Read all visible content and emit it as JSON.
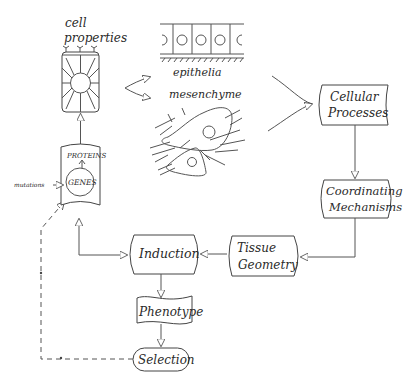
{
  "diagram": {
    "type": "flowchart",
    "nodes": {
      "cell_properties": {
        "label_line1": "cell",
        "label_line2": "properties"
      },
      "epithelia": {
        "label": "epithelia"
      },
      "mesenchyme": {
        "label": "mesenchyme"
      },
      "genome_box": {
        "proteins": "PROTEINS",
        "genes": "GENES",
        "mutations": "mutations"
      },
      "cellular_processes": {
        "line1": "Cellular",
        "line2": "Processes"
      },
      "coordinating_mechanisms": {
        "line1": "Coordinating",
        "line2": "Mechanisms"
      },
      "tissue_geometry": {
        "line1": "Tissue",
        "line2": "Geometry"
      },
      "induction": {
        "label": "Induction"
      },
      "phenotype": {
        "label": "Phenotype"
      },
      "selection": {
        "label": "Selection"
      }
    },
    "edges": [
      {
        "from": "genome_box",
        "to": "cell_properties",
        "style": "solid"
      },
      {
        "from": "cell_properties",
        "to": "epithelia",
        "style": "solid"
      },
      {
        "from": "cell_properties",
        "to": "mesenchyme",
        "style": "solid"
      },
      {
        "from": "epithelia",
        "to": "cellular_processes",
        "style": "solid"
      },
      {
        "from": "mesenchyme",
        "to": "cellular_processes",
        "style": "solid"
      },
      {
        "from": "cellular_processes",
        "to": "coordinating_mechanisms",
        "style": "solid"
      },
      {
        "from": "coordinating_mechanisms",
        "to": "tissue_geometry",
        "style": "solid"
      },
      {
        "from": "tissue_geometry",
        "to": "induction",
        "style": "solid"
      },
      {
        "from": "induction",
        "to": "genome_box",
        "style": "solid-bidirectional"
      },
      {
        "from": "induction",
        "to": "phenotype",
        "style": "solid"
      },
      {
        "from": "phenotype",
        "to": "selection",
        "style": "solid"
      },
      {
        "from": "selection",
        "to": "genome_box",
        "style": "dashed"
      }
    ],
    "colors": {
      "line": "#444444",
      "text": "#2a2a2a",
      "background": "#ffffff"
    }
  }
}
